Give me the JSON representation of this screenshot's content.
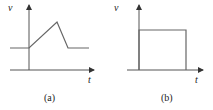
{
  "panels": [
    {
      "id": "a",
      "caption": "(a)",
      "y_label": "v",
      "x_label": "t",
      "description": "Waveform: constant level, then linear ramp up to a peak, sharp linear fall back to the original level, then constant",
      "shape": "triangular-pulse-on-offset"
    },
    {
      "id": "b",
      "caption": "(b)",
      "y_label": "v",
      "x_label": "t",
      "description": "Waveform: rectangular pulse starting at the origin, constant high level, then drops back to zero",
      "shape": "rectangular-pulse"
    }
  ],
  "colors": {
    "axis": "#555555",
    "signal": "#666666",
    "text": "#222222"
  }
}
